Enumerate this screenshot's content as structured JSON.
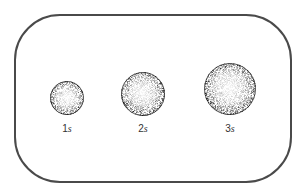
{
  "diagram": {
    "frame": {
      "stroke": "#4a4a4a"
    },
    "orbitals": [
      {
        "n": "1",
        "letter": "s",
        "cx": 67,
        "cy": 98,
        "r": 17
      },
      {
        "n": "2",
        "letter": "s",
        "cx": 143,
        "cy": 94,
        "r": 22
      },
      {
        "n": "3",
        "letter": "s",
        "cx": 230,
        "cy": 89,
        "r": 26
      }
    ],
    "label_y": 123
  }
}
